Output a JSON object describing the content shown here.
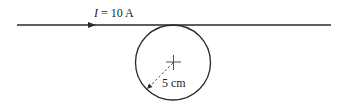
{
  "diagram": {
    "current_label_symbol": "I",
    "current_label_rest": " = 10 A",
    "radius_label": "5 cm",
    "elements": {
      "wire": "straight wire carrying current to the right",
      "loop": "circular loop tangent to the wire below it",
      "center_mark": "cross at loop center",
      "radius_indicator": "dashed arrow from center to loop edge"
    },
    "colors": {
      "stroke": "#2a2a2a"
    }
  }
}
